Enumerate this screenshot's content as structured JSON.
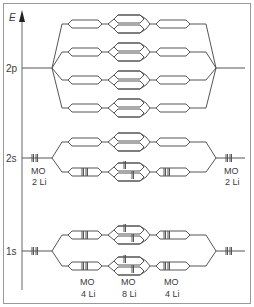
{
  "diagram": {
    "type": "molecular-orbital-energy-diagram",
    "axis_label": "E",
    "levels": [
      {
        "label": "2p",
        "y": 68,
        "rows": [
          24,
          52,
          80,
          108
        ],
        "filled": false
      },
      {
        "label": "2s",
        "y": 158,
        "rows": [
          142,
          172
        ],
        "filled_rows": [
          172
        ],
        "left_label_line1": "MO",
        "left_label_line2": "2 Li",
        "right_label_line1": "MO",
        "right_label_line2": "2 Li"
      },
      {
        "label": "1s",
        "y": 251,
        "rows": [
          235,
          266
        ],
        "filled_rows": [
          235,
          266
        ]
      }
    ],
    "bottom_labels": [
      {
        "line1": "MO",
        "line2": "4 Li"
      },
      {
        "line1": "MO",
        "line2": "8 Li"
      },
      {
        "line1": "MO",
        "line2": "4 Li"
      }
    ],
    "colors": {
      "line": "#555555",
      "frame": "#9a9a9a",
      "text": "#3a3a3a"
    }
  }
}
